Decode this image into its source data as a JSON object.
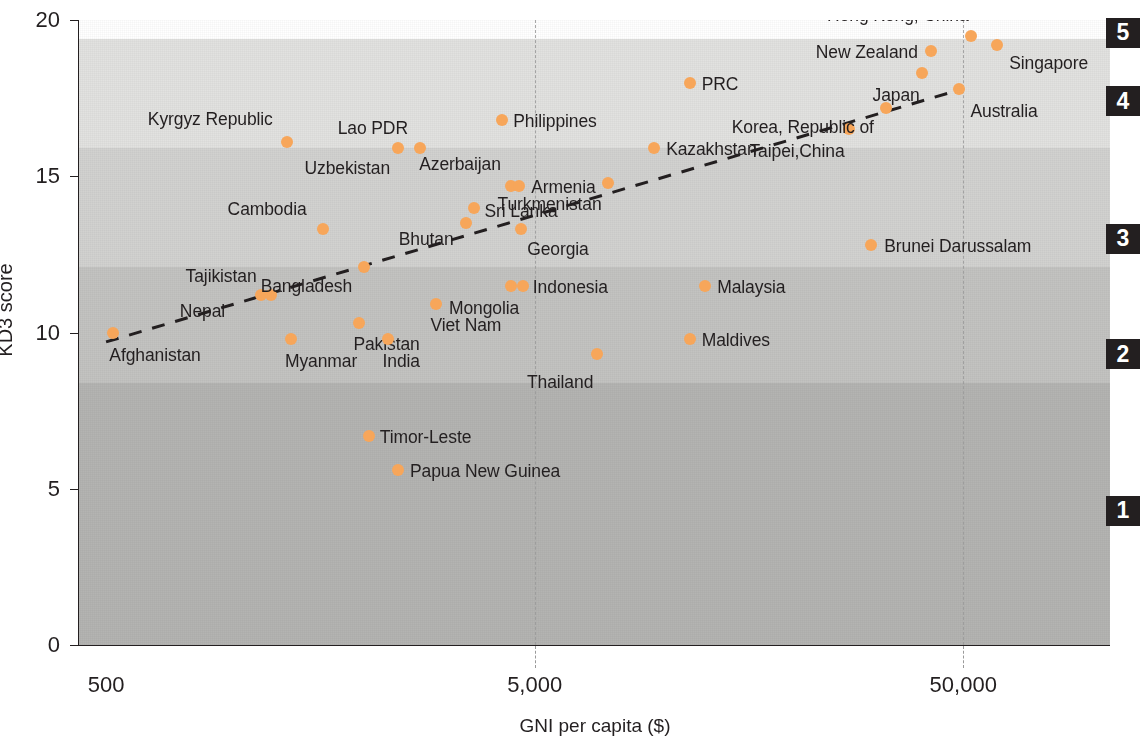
{
  "chart_data": {
    "type": "scatter",
    "title": "",
    "xlabel": "GNI per capita ($)",
    "ylabel": "KD3 score",
    "xscale": "log",
    "x_ticks": [
      "500",
      "5,000",
      "50,000"
    ],
    "x_tick_values": [
      500,
      5000,
      50000
    ],
    "y_ticks": [
      "0",
      "5",
      "10",
      "15",
      "20"
    ],
    "y_tick_values": [
      0,
      5,
      10,
      15,
      20
    ],
    "ylim": [
      0,
      20
    ],
    "xlim": [
      430,
      110000
    ],
    "grid": "vertical dashed at x ticks",
    "legend_position": "right edge, band keys",
    "accent_color": "#f7a65a",
    "text_color": "#231f20",
    "trendline": {
      "style": "dashed",
      "color": "#231f20",
      "x_start": 500,
      "y_start": 9.7,
      "x_end": 50000,
      "y_end": 17.8
    },
    "bands": [
      {
        "label": "5",
        "y_from": 19.4,
        "y_to": 20.0,
        "shade": "#ffffff"
      },
      {
        "label": "4",
        "y_from": 15.9,
        "y_to": 19.4,
        "shade": "#e2e2e0"
      },
      {
        "label": "3",
        "y_from": 12.1,
        "y_to": 15.9,
        "shade": "#d2d2d0"
      },
      {
        "label": "2",
        "y_from": 8.4,
        "y_to": 12.1,
        "shade": "#c3c3c1"
      },
      {
        "label": "1",
        "y_from": 0.0,
        "y_to": 8.4,
        "shade": "#b4b4b2"
      }
    ],
    "band_keys": [
      {
        "label": "5",
        "y": 19.6
      },
      {
        "label": "4",
        "y": 17.4
      },
      {
        "label": "3",
        "y": 13.0
      },
      {
        "label": "2",
        "y": 9.3
      },
      {
        "label": "1",
        "y": 4.3
      }
    ],
    "points": [
      {
        "name": "Afghanistan",
        "x": 520,
        "y": 10.0,
        "label_dx": -4,
        "label_dy": 22,
        "align": "left"
      },
      {
        "name": "Nepal",
        "x": 1150,
        "y": 11.2,
        "label_dx": -36,
        "label_dy": 16,
        "align": "right"
      },
      {
        "name": "Tajikistan",
        "x": 1210,
        "y": 11.2,
        "label_dx": -14,
        "label_dy": -19,
        "align": "right"
      },
      {
        "name": "Myanmar",
        "x": 1350,
        "y": 9.8,
        "label_dx": -6,
        "label_dy": 22,
        "align": "left"
      },
      {
        "name": "Cambodia",
        "x": 1600,
        "y": 13.3,
        "label_dx": -16,
        "label_dy": -20,
        "align": "right"
      },
      {
        "name": "Kyrgyz Republic",
        "x": 1320,
        "y": 16.1,
        "label_dx": -14,
        "label_dy": -23,
        "align": "right"
      },
      {
        "name": "Bangladesh",
        "x": 2000,
        "y": 12.1,
        "label_dx": -12,
        "label_dy": 19,
        "align": "right"
      },
      {
        "name": "Pakistan",
        "x": 1950,
        "y": 10.3,
        "label_dx": -6,
        "label_dy": 21,
        "align": "left"
      },
      {
        "name": "India",
        "x": 2280,
        "y": 9.8,
        "label_dx": -6,
        "label_dy": 22,
        "align": "left"
      },
      {
        "name": "Timor-Leste",
        "x": 2050,
        "y": 6.7,
        "label_dx": 11,
        "label_dy": 1,
        "align": "left"
      },
      {
        "name": "Uzbekistan",
        "x": 2400,
        "y": 15.9,
        "label_dx": -8,
        "label_dy": 20,
        "align": "right"
      },
      {
        "name": "Lao PDR",
        "x": 2700,
        "y": 15.9,
        "label_dx": -12,
        "label_dy": -20,
        "align": "right"
      },
      {
        "name": "Papua New Guinea",
        "x": 2400,
        "y": 5.6,
        "label_dx": 12,
        "label_dy": 1,
        "align": "left"
      },
      {
        "name": "Viet Nam",
        "x": 2950,
        "y": 10.9,
        "label_dx": -6,
        "label_dy": 21,
        "align": "left"
      },
      {
        "name": "Bhutan",
        "x": 3450,
        "y": 13.5,
        "label_dx": -12,
        "label_dy": 16,
        "align": "right"
      },
      {
        "name": "Sri Lanka",
        "x": 3600,
        "y": 14.0,
        "label_dx": 11,
        "label_dy": 3,
        "align": "left"
      },
      {
        "name": "Philippines",
        "x": 4200,
        "y": 16.8,
        "label_dx": 11,
        "label_dy": 1,
        "align": "left"
      },
      {
        "name": "Azerbaijan",
        "x": 4400,
        "y": 14.7,
        "label_dx": -10,
        "label_dy": -22,
        "align": "right"
      },
      {
        "name": "Armenia",
        "x": 4600,
        "y": 14.7,
        "label_dx": 12,
        "label_dy": 1,
        "align": "left"
      },
      {
        "name": "Georgia",
        "x": 4650,
        "y": 13.3,
        "label_dx": 6,
        "label_dy": 20,
        "align": "left"
      },
      {
        "name": "Indonesia",
        "x": 4400,
        "y": 11.5,
        "label_dx": 22,
        "label_dy": 1,
        "align": "left"
      },
      {
        "name": "Mongolia",
        "x": 4700,
        "y": 11.5,
        "label_dx": -4,
        "label_dy": 22,
        "align": "right"
      },
      {
        "name": "Thailand",
        "x": 7000,
        "y": 9.3,
        "label_dx": -4,
        "label_dy": 28,
        "align": "right"
      },
      {
        "name": "Turkmenistan",
        "x": 7400,
        "y": 14.8,
        "label_dx": -6,
        "label_dy": 21,
        "align": "right"
      },
      {
        "name": "Kazakhstan",
        "x": 9500,
        "y": 15.9,
        "label_dx": 12,
        "label_dy": 1,
        "align": "left"
      },
      {
        "name": "PRC",
        "x": 11500,
        "y": 18.0,
        "label_dx": 12,
        "label_dy": 1,
        "align": "left"
      },
      {
        "name": "Maldives",
        "x": 11500,
        "y": 9.8,
        "label_dx": 12,
        "label_dy": 1,
        "align": "left"
      },
      {
        "name": "Malaysia",
        "x": 12500,
        "y": 11.5,
        "label_dx": 12,
        "label_dy": 1,
        "align": "left"
      },
      {
        "name": "Taipei,China",
        "x": 27000,
        "y": 16.5,
        "label_dx": -4,
        "label_dy": 22,
        "align": "right"
      },
      {
        "name": "Brunei Darussalam",
        "x": 30500,
        "y": 12.8,
        "label_dx": 13,
        "label_dy": 1,
        "align": "left"
      },
      {
        "name": "Korea, Republic of",
        "x": 33000,
        "y": 17.2,
        "label_dx": -12,
        "label_dy": 19,
        "align": "right"
      },
      {
        "name": "Japan",
        "x": 40000,
        "y": 18.3,
        "label_dx": -2,
        "label_dy": 22,
        "align": "right"
      },
      {
        "name": "New Zealand",
        "x": 42000,
        "y": 19.0,
        "label_dx": -13,
        "label_dy": 1,
        "align": "right"
      },
      {
        "name": "Australia",
        "x": 49000,
        "y": 17.8,
        "label_dx": 11,
        "label_dy": 22,
        "align": "left"
      },
      {
        "name": "Hong Kong, China",
        "x": 52000,
        "y": 19.5,
        "label_dx": -2,
        "label_dy": -21,
        "align": "right"
      },
      {
        "name": "Singapore",
        "x": 60000,
        "y": 19.2,
        "label_dx": 12,
        "label_dy": 18,
        "align": "left"
      }
    ]
  }
}
